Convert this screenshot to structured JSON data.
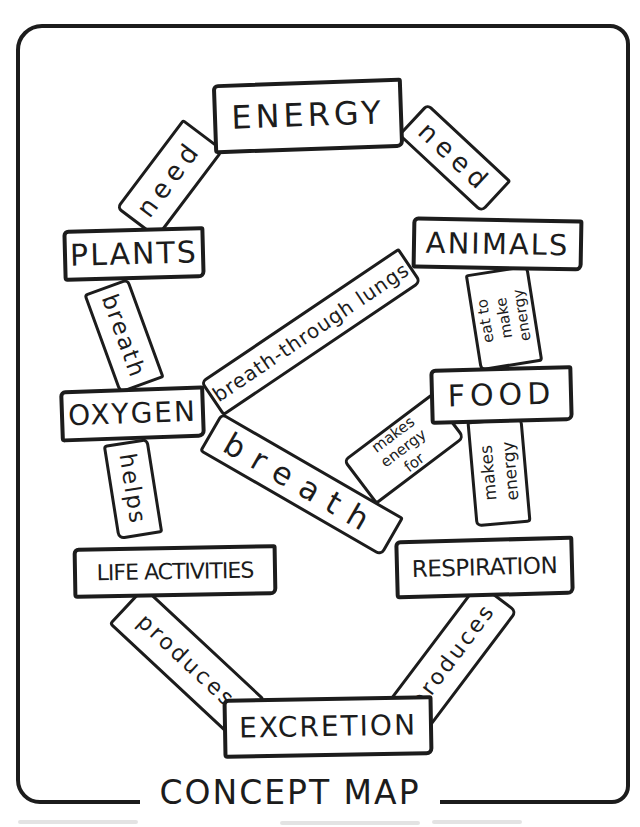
{
  "page": {
    "title_label": "CONCEPT MAP",
    "ink_color": "#1c1c1c",
    "paper_color": "#ffffff"
  },
  "nodes": {
    "energy": {
      "label": "ENERGY"
    },
    "plants": {
      "label": "PLANTS"
    },
    "animals": {
      "label": "ANIMALS"
    },
    "oxygen": {
      "label": "OXYGEN"
    },
    "food": {
      "label": "FOOD"
    },
    "life_activities": {
      "label": "LIFE ACTIVITIES"
    },
    "respiration": {
      "label": "RESPIRATION"
    },
    "excretion": {
      "label": "EXCRETION"
    }
  },
  "connectors": {
    "need_left": {
      "label": "need"
    },
    "need_right": {
      "label": "need"
    },
    "breath_plants_oxygen": {
      "label": "breath"
    },
    "breath_through_lungs": {
      "label": "breath-through lungs"
    },
    "eat_to_make_energy": {
      "label": "eat to make energy",
      "lines": [
        "eat to",
        "make",
        "energy"
      ]
    },
    "helps": {
      "label": "helps"
    },
    "breath_center": {
      "label": "breath"
    },
    "makes_energy_for": {
      "label": "makes energy for",
      "lines": [
        "makes",
        "energy",
        "for"
      ]
    },
    "makes_energy": {
      "label": "makes energy",
      "lines": [
        "makes",
        "energy"
      ]
    },
    "produces_left": {
      "label": "produces"
    },
    "produces_right": {
      "label": "produces"
    }
  }
}
